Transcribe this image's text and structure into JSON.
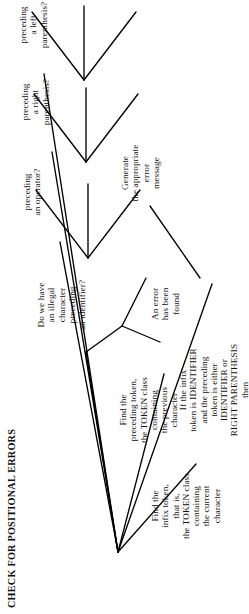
{
  "diagram": {
    "type": "flowchart",
    "title": "CHECK FOR POSITIONAL ERRORS",
    "orientation": "rotated-90-ccw",
    "nodes": [
      {
        "id": "find-infix-token",
        "text": "Find the\ninfix token,\nthat is,\nthe TOKEN class\ncontaining\nthe current\ncharacter"
      },
      {
        "id": "find-preceding-token",
        "text": "Find the\npreceding token,\nthe TOKEN class\ncontaining\nthe previous\ncharacter"
      },
      {
        "id": "illegal-character-identifier",
        "text": "Do we have\nan illegal\ncharacter\npreceding\nan identifier?"
      },
      {
        "id": "preceding-an-operator",
        "text": "preceding\nan operator?"
      },
      {
        "id": "preceding-a-right-parenthesis",
        "text": "preceding\na right\nparenthesis?"
      },
      {
        "id": "preceding-a-left-parenthesis",
        "text": "preceding\na left\nparenthesis?"
      },
      {
        "id": "an-error-has-been-found",
        "text": "An error\nhas been\nfound"
      },
      {
        "id": "generate-error-message",
        "text": "Generate\nthe appropriate\nerror\nmessage"
      },
      {
        "id": "if-the-infix-rule",
        "text": "If the infix\ntoken is IDENTIFIER\nand the preceding\ntoken is either\nIDENTIFIER or\nRIGHT PARENTHESIS\nthen"
      }
    ],
    "colors": {
      "background": "#ffffff",
      "ink": "#111111",
      "edge": "#000000"
    }
  }
}
